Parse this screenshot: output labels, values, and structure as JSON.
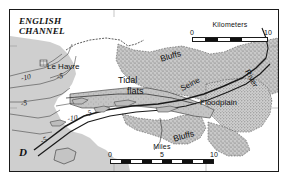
{
  "figure": {
    "panel_label": "D",
    "type": "physiographic map",
    "region": "Seine estuary, France"
  },
  "map": {
    "water_body": {
      "name_line1": "ENGLISH",
      "name_line2": "CHANNEL"
    },
    "places": {
      "city": "Le Havre"
    },
    "features": [
      {
        "id": "tidal-flats",
        "label_line1": "Tidal",
        "label_line2": "flats"
      },
      {
        "id": "bluffs-north",
        "label": "Bluffs"
      },
      {
        "id": "bluffs-south",
        "label": "Bluffs"
      },
      {
        "id": "floodplain",
        "label": "Floodplain"
      },
      {
        "id": "seine-river",
        "label": "Seine"
      },
      {
        "id": "river-tributary",
        "label": "River"
      }
    ],
    "bathymetry_contours": [
      {
        "label": "-10"
      },
      {
        "label": "-5"
      },
      {
        "label": "-5"
      },
      {
        "label": "-10"
      },
      {
        "label": "-5"
      },
      {
        "label": "-5"
      }
    ],
    "colors": {
      "water": "#d3d3d3",
      "land_upland": "#c9c9c9",
      "floodplain_stipple": "#b5b5b5",
      "tidal_flats": "#bdbdbd",
      "line": "#1a1a1a",
      "background": "#ffffff"
    }
  },
  "scalebars": [
    {
      "id": "kilometers",
      "title": "Kilometers",
      "ticks": [
        "0",
        "10"
      ],
      "segments": 6
    },
    {
      "id": "miles",
      "title": "Miles",
      "ticks": [
        "0",
        "5",
        "10"
      ],
      "segments": 10
    }
  ]
}
